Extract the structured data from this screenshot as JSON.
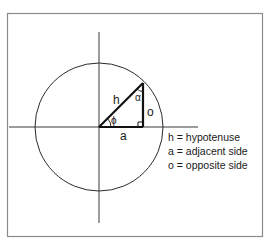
{
  "diagram": {
    "type": "unit-circle-right-triangle",
    "colors": {
      "frame": "#7a7a7a",
      "axis": "#3a3a3a",
      "circle": "#2a2a2a",
      "triangle": "#111111",
      "text": "#1a1a1a"
    },
    "labels": {
      "hypotenuse": "h",
      "adjacent": "a",
      "opposite": "o",
      "angle_at_origin": "ϕ",
      "angle_at_apex": "α"
    },
    "legend": [
      {
        "text": "h = hypotenuse"
      },
      {
        "text": "a = adjacent side"
      },
      {
        "text": "o = opposite side"
      }
    ]
  }
}
